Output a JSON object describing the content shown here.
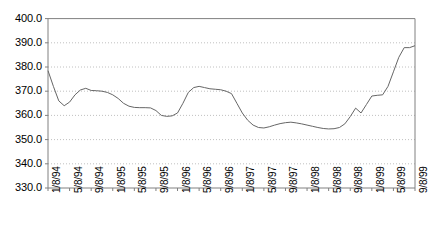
{
  "chart_data": {
    "type": "line",
    "title": "",
    "subtitle": "",
    "xlabel": "",
    "ylabel": "",
    "grid": true,
    "legend": null,
    "legend_position": "none",
    "ylim": [
      330.0,
      400.0
    ],
    "ytick_step": 10.0,
    "yticks": [
      "400.0",
      "390.0",
      "380.0",
      "370.0",
      "360.0",
      "350.0",
      "340.0",
      "330.0"
    ],
    "ytick_values": [
      400.0,
      390.0,
      380.0,
      370.0,
      360.0,
      350.0,
      340.0,
      330.0
    ],
    "xticks": [
      "1/8/94",
      "5/8/94",
      "9/8/94",
      "1/8/95",
      "5/8/95",
      "9/8/95",
      "1/8/96",
      "5/8/96",
      "9/8/96",
      "1/8/97",
      "5/8/97",
      "9/8/97",
      "1/8/98",
      "5/8/98",
      "9/8/98",
      "1/8/99",
      "5/8/99",
      "9/8/99"
    ],
    "xtick_interval_months": 4,
    "x_start": "1/8/94",
    "x_end": "9/8/99",
    "n_points": 69,
    "line_color": "#666666",
    "grid_color": "#b0b0b0",
    "axis_color": "#808080",
    "series": [
      {
        "name": "series-1",
        "values": [
          378.5,
          372.0,
          366.0,
          364.0,
          365.5,
          368.5,
          370.5,
          371.2,
          370.3,
          370.2,
          370.0,
          369.5,
          368.5,
          367.0,
          365.0,
          363.8,
          363.3,
          363.2,
          363.2,
          363.1,
          362.0,
          360.0,
          359.6,
          359.8,
          361.0,
          365.0,
          369.5,
          371.5,
          372.0,
          371.5,
          371.0,
          370.8,
          370.6,
          370.0,
          369.0,
          365.0,
          361.0,
          358.0,
          356.0,
          355.0,
          354.8,
          355.3,
          356.0,
          356.6,
          357.0,
          357.2,
          356.9,
          356.5,
          356.0,
          355.5,
          355.0,
          354.6,
          354.4,
          354.5,
          355.0,
          356.5,
          359.5,
          363.0,
          361.0,
          364.5,
          368.0,
          368.3,
          368.5,
          372.0,
          378.0,
          384.0,
          388.0,
          388.0,
          388.8
        ]
      }
    ]
  },
  "plot_geometry": {
    "left": 48,
    "right": 415,
    "top": 18.6,
    "bottom": 188
  }
}
